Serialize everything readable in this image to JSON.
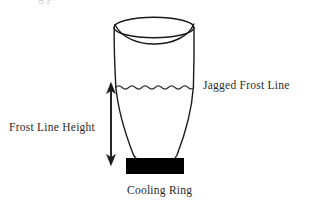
{
  "figure": {
    "title_clipped_fragment": "g p",
    "background_color": "#ffffff",
    "stroke_color": "#1a1a1a",
    "text_color": "#2b2b2b",
    "cooling_ring_fill": "#000000"
  },
  "labels": {
    "jagged_frost_line": "Jagged Frost Line",
    "frost_line_height": "Frost Line Height",
    "cooling_ring": "Cooling Ring"
  },
  "icons": {
    "double_headed_arrow": "double-headed-arrow-icon",
    "wavy_line": "wavy-frost-line-icon",
    "bubble_outline": "blown-film-bubble-icon"
  },
  "geometry": {
    "bubble_top_ellipse": {
      "cx": 154,
      "cy": 27,
      "rx": 40,
      "ry": 10
    },
    "frost_line_y": 87,
    "frost_line_x_start": 116,
    "frost_line_x_end": 193,
    "arrow_x": 111,
    "arrow_y_top": 85,
    "arrow_y_bottom": 163,
    "cooling_ring_rect": {
      "x": 126,
      "y": 158,
      "w": 58,
      "h": 16
    }
  }
}
